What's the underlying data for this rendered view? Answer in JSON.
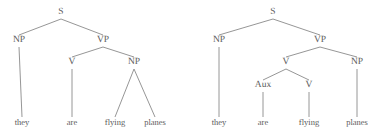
{
  "figure": {
    "width": 380,
    "height": 134,
    "background_color": "#ffffff",
    "line_color": "#8a8a8a",
    "text_color": "#5a5a5a"
  },
  "trees": [
    {
      "id": "tree-left",
      "reading": "they are flying planes (progressive verb reading)",
      "sentence": "they are flying planes",
      "nodes": [
        {
          "id": "L-S",
          "label": "S",
          "x": 61,
          "y": 13,
          "type": "nonterminal"
        },
        {
          "id": "L-NP1",
          "label": "NP",
          "x": 19,
          "y": 41,
          "type": "nonterminal"
        },
        {
          "id": "L-VP",
          "label": "VP",
          "x": 103,
          "y": 41,
          "type": "nonterminal"
        },
        {
          "id": "L-V",
          "label": "V",
          "x": 72,
          "y": 63,
          "type": "nonterminal"
        },
        {
          "id": "L-NP2",
          "label": "NP",
          "x": 134,
          "y": 63,
          "type": "nonterminal"
        },
        {
          "id": "L-they",
          "label": "they",
          "x": 22,
          "y": 122,
          "type": "terminal"
        },
        {
          "id": "L-are",
          "label": "are",
          "x": 72,
          "y": 122,
          "type": "terminal"
        },
        {
          "id": "L-flying",
          "label": "flying",
          "x": 115,
          "y": 122,
          "type": "terminal"
        },
        {
          "id": "L-planes",
          "label": "planes",
          "x": 155,
          "y": 122,
          "type": "terminal"
        }
      ],
      "edges": [
        {
          "from": "L-S",
          "to": "L-NP1"
        },
        {
          "from": "L-S",
          "to": "L-VP"
        },
        {
          "from": "L-VP",
          "to": "L-V"
        },
        {
          "from": "L-VP",
          "to": "L-NP2"
        },
        {
          "from": "L-NP1",
          "to": "L-they"
        },
        {
          "from": "L-V",
          "to": "L-are"
        },
        {
          "from": "L-NP2",
          "to": "L-flying"
        },
        {
          "from": "L-NP2",
          "to": "L-planes"
        }
      ]
    },
    {
      "id": "tree-right",
      "reading": "they are flying planes (auxiliary + main verb reading)",
      "sentence": "they are flying planes",
      "nodes": [
        {
          "id": "R-S",
          "label": "S",
          "x": 273,
          "y": 13,
          "type": "nonterminal"
        },
        {
          "id": "R-NP1",
          "label": "NP",
          "x": 219,
          "y": 41,
          "type": "nonterminal"
        },
        {
          "id": "R-VP",
          "label": "VP",
          "x": 320,
          "y": 41,
          "type": "nonterminal"
        },
        {
          "id": "R-V1",
          "label": "V",
          "x": 286,
          "y": 63,
          "type": "nonterminal"
        },
        {
          "id": "R-NP2",
          "label": "NP",
          "x": 357,
          "y": 63,
          "type": "nonterminal"
        },
        {
          "id": "R-Aux",
          "label": "Aux",
          "x": 263,
          "y": 86,
          "type": "nonterminal"
        },
        {
          "id": "R-V2",
          "label": "V",
          "x": 309,
          "y": 86,
          "type": "nonterminal"
        },
        {
          "id": "R-they",
          "label": "they",
          "x": 219,
          "y": 122,
          "type": "terminal"
        },
        {
          "id": "R-are",
          "label": "are",
          "x": 263,
          "y": 122,
          "type": "terminal"
        },
        {
          "id": "R-flying",
          "label": "flying",
          "x": 309,
          "y": 122,
          "type": "terminal"
        },
        {
          "id": "R-planes",
          "label": "planes",
          "x": 357,
          "y": 122,
          "type": "terminal"
        }
      ],
      "edges": [
        {
          "from": "R-S",
          "to": "R-NP1"
        },
        {
          "from": "R-S",
          "to": "R-VP"
        },
        {
          "from": "R-VP",
          "to": "R-V1"
        },
        {
          "from": "R-VP",
          "to": "R-NP2"
        },
        {
          "from": "R-V1",
          "to": "R-Aux"
        },
        {
          "from": "R-V1",
          "to": "R-V2"
        },
        {
          "from": "R-NP1",
          "to": "R-they"
        },
        {
          "from": "R-Aux",
          "to": "R-are"
        },
        {
          "from": "R-V2",
          "to": "R-flying"
        },
        {
          "from": "R-NP2",
          "to": "R-planes"
        }
      ]
    }
  ]
}
